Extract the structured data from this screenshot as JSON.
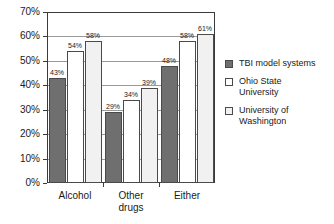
{
  "chart_data": {
    "type": "bar",
    "title": "",
    "xlabel": "",
    "ylabel": "",
    "categories": [
      "Alcohol",
      "Other drugs",
      "Either"
    ],
    "series": [
      {
        "name": "TBI model systems",
        "color": "#6f6f6f",
        "values": [
          43,
          54,
          48
        ]
      },
      {
        "name": "Ohio State University",
        "color": "#ffffff",
        "values": [
          0,
          0,
          0
        ]
      },
      {
        "name": "University of Washington",
        "color": "#f1f1f1",
        "values": [
          0,
          0,
          0
        ]
      }
    ],
    "groups": [
      {
        "category": "Alcohol",
        "category_lines": [
          "Alcohol"
        ],
        "bars": [
          {
            "series": "TBI model systems",
            "value": 43,
            "label": "43%"
          },
          {
            "series": "Ohio State University",
            "value": 54,
            "label": "54%"
          },
          {
            "series": "University of Washington",
            "value": 58,
            "label": "58%"
          }
        ]
      },
      {
        "category": "Other drugs",
        "category_lines": [
          "Other",
          "drugs"
        ],
        "bars": [
          {
            "series": "TBI model systems",
            "value": 29,
            "label": "29%"
          },
          {
            "series": "Ohio State University",
            "value": 34,
            "label": "34%"
          },
          {
            "series": "University of Washington",
            "value": 39,
            "label": "39%"
          }
        ]
      },
      {
        "category": "Either",
        "category_lines": [
          "Either"
        ],
        "bars": [
          {
            "series": "TBI model systems",
            "value": 48,
            "label": "48%"
          },
          {
            "series": "Ohio State University",
            "value": 58,
            "label": "58%"
          },
          {
            "series": "University of Washington",
            "value": 61,
            "label": "61%"
          }
        ]
      }
    ],
    "ylim": [
      0,
      70
    ],
    "ytick_values": [
      0,
      10,
      20,
      30,
      40,
      50,
      60,
      70
    ],
    "ytick_labels": [
      "0%",
      "10%",
      "20%",
      "30%",
      "40%",
      "50%",
      "60%",
      "70%"
    ],
    "grid": true,
    "legend_position": "right",
    "legend": [
      {
        "label": "TBI model systems",
        "lines": [
          "TBI model systems"
        ],
        "color": "#6f6f6f"
      },
      {
        "label": "Ohio State University",
        "lines": [
          "Ohio State",
          "University"
        ],
        "color": "#ffffff"
      },
      {
        "label": "University of Washington",
        "lines": [
          "University of",
          "Washington"
        ],
        "color": "#f1f1f1"
      }
    ]
  }
}
